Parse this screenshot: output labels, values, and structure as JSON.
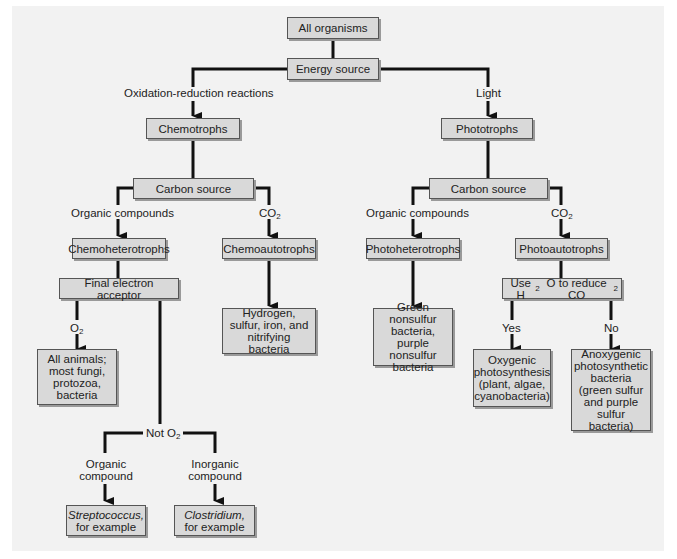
{
  "diagram": {
    "nodes": {
      "root": "All organisms",
      "energy": "Energy source",
      "chemotrophs": "Chemotrophs",
      "phototrophs": "Phototrophs",
      "carbon_left": "Carbon source",
      "carbon_right": "Carbon source",
      "chemoheterotrophs": "Chemoheterotrophs",
      "chemoautotrophs": "Chemoautotrophs",
      "photoheterotrophs": "Photoheterotrophs",
      "photoautotrophs": "Photoautotrophs",
      "final_acceptor": "Final electron acceptor",
      "chemoauto_examples": "Hydrogen, sulfur, iron, and nitrifying bacteria",
      "aerobic_examples": "All animals; most fungi, protozoa, bacteria",
      "photohetero_examples": "Green nonsulfur bacteria, purple nonsulfur bacteria",
      "use_h2o_prefix": "Use H",
      "use_h2o_sub1": "2",
      "use_h2o_mid": "O to reduce CO",
      "use_h2o_sub2": "2",
      "oxygenic": "Oxygenic photosynthesis (plant, algae, cyanobacteria)",
      "anoxygenic": "Anoxygenic photosynthetic bacteria (green sulfur and purple sulfur bacteria)",
      "strep_italic": "Streptococcus,",
      "strep_rest": "for example",
      "clos_italic": "Clostridium,",
      "clos_rest": "for example"
    },
    "edge_labels": {
      "redox": "Oxidation-reduction reactions",
      "light": "Light",
      "organic_left": "Organic compounds",
      "co2_left_main": "CO",
      "co2_left_sub": "2",
      "organic_right": "Organic compounds",
      "co2_right_main": "CO",
      "co2_right_sub": "2",
      "o2_main": "O",
      "o2_sub": "2",
      "not_o2_main": "Not O",
      "not_o2_sub": "2",
      "organic_compound": "Organic compound",
      "inorganic_compound": "Inorganic compound",
      "yes": "Yes",
      "no": "No"
    }
  }
}
